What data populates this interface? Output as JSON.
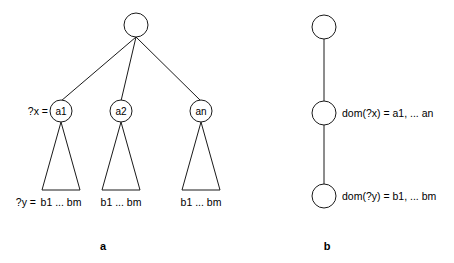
{
  "figure": {
    "background_color": "#ffffff",
    "stroke_color": "#1a1a1a",
    "panels": [
      {
        "caption": "a",
        "caption_x": 103,
        "caption_y": 250
      },
      {
        "caption": "b",
        "caption_x": 327,
        "caption_y": 250
      }
    ]
  },
  "panel_a": {
    "root": {
      "label": "",
      "cx": 136,
      "cy": 25,
      "r": 12
    },
    "variable_x_label": "?x =",
    "variable_y_label": "?y =",
    "children": [
      {
        "label": "a1",
        "cx": 61,
        "cy": 111,
        "r": 11
      },
      {
        "label": "a2",
        "cx": 121,
        "cy": 111,
        "r": 11
      },
      {
        "label": "an",
        "cx": 201,
        "cy": 111,
        "r": 11
      }
    ],
    "subtrees": [
      {
        "leaf_label": "b1 ... bm",
        "apex_x": 61,
        "apex_y": 122,
        "base_left_x": 42,
        "base_right_x": 80,
        "base_y": 190
      },
      {
        "leaf_label": "b1 ... bm",
        "apex_x": 121,
        "apex_y": 122,
        "base_left_x": 102,
        "base_right_x": 140,
        "base_y": 190
      },
      {
        "leaf_label": "b1 ... bm",
        "apex_x": 201,
        "apex_y": 122,
        "base_left_x": 182,
        "base_right_x": 220,
        "base_y": 190
      }
    ]
  },
  "panel_b": {
    "nodes": [
      {
        "label": "",
        "cx": 324,
        "cy": 27,
        "r": 12,
        "annotation": ""
      },
      {
        "label": "",
        "cx": 324,
        "cy": 113,
        "r": 12,
        "annotation": "dom(?x) = a1, ... an"
      },
      {
        "label": "",
        "cx": 324,
        "cy": 196,
        "r": 12,
        "annotation": "dom(?y) = b1, ... bm"
      }
    ]
  }
}
